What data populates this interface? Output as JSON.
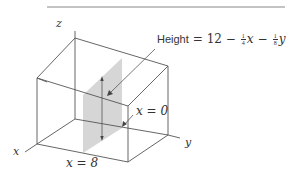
{
  "figure": {
    "type": "3d-box-cross-section",
    "colors": {
      "lines": "#555555",
      "shaded_plane": "#d6d6d6",
      "rule": "#888888",
      "text": "#333333"
    },
    "axes": {
      "x": "x",
      "y": "y",
      "z": "z"
    },
    "labels": {
      "height_prefix": "Height",
      "height_eq": "= 12 −",
      "frac1_num": "1",
      "frac1_den": "4",
      "var_x": "x",
      "minus": "−",
      "frac2_num": "1",
      "frac2_den": "8",
      "var_y": "y",
      "x_eq_0": "x = 0",
      "x_eq_8": "x = 8"
    }
  }
}
